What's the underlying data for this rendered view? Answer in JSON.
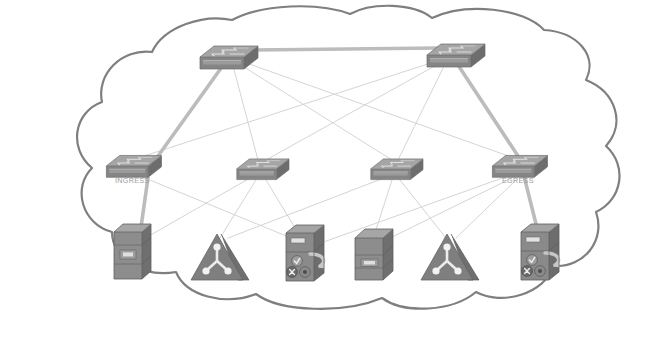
{
  "diagram": {
    "type": "network-topology",
    "canvas": {
      "width": 645,
      "height": 339
    },
    "colors": {
      "background": "#ffffff",
      "cloud_outline": "#7f7f7f",
      "cloud_fill": "#ffffff",
      "link_default": "#cfcfcf",
      "link_highlight": "#b3b3b3",
      "device_top": "#a8a8a8",
      "device_front": "#8f8f8f",
      "device_side": "#707070",
      "device_dark": "#6e6e6e",
      "label_text": "#9a9a9a",
      "icon_detail": "#e6e6e6"
    },
    "cloud": {
      "name": "network-cloud-boundary",
      "stroke_width": 2.2
    },
    "nodes": [
      {
        "id": "core-left",
        "kind": "switch",
        "label": "",
        "x": 228,
        "y": 55,
        "scale": 1.0,
        "tier": "core"
      },
      {
        "id": "core-right",
        "kind": "switch",
        "label": "",
        "x": 455,
        "y": 53,
        "scale": 1.0,
        "tier": "core"
      },
      {
        "id": "access-1",
        "kind": "switch",
        "label": "INGRESS",
        "x": 133,
        "y": 164,
        "scale": 0.95,
        "tier": "access"
      },
      {
        "id": "access-2",
        "kind": "switch",
        "label": "",
        "x": 262,
        "y": 167,
        "scale": 0.9,
        "tier": "access"
      },
      {
        "id": "access-3",
        "kind": "switch",
        "label": "",
        "x": 396,
        "y": 167,
        "scale": 0.9,
        "tier": "access"
      },
      {
        "id": "access-4",
        "kind": "switch",
        "label": "EGRESS",
        "x": 519,
        "y": 164,
        "scale": 0.95,
        "tier": "access"
      },
      {
        "id": "server-1",
        "kind": "server",
        "label": "",
        "x": 131,
        "y": 254,
        "scale": 1.0,
        "tier": "edge"
      },
      {
        "id": "loadbalancer-1",
        "kind": "triangle-hub",
        "label": "",
        "x": 219,
        "y": 258,
        "scale": 1.0,
        "tier": "edge"
      },
      {
        "id": "firewall-1",
        "kind": "firewall",
        "label": "",
        "x": 304,
        "y": 255,
        "scale": 1.0,
        "tier": "edge"
      },
      {
        "id": "server-2",
        "kind": "server",
        "label": "",
        "x": 372,
        "y": 256,
        "scale": 1.0,
        "tier": "edge"
      },
      {
        "id": "loadbalancer-2",
        "kind": "triangle-hub",
        "label": "",
        "x": 449,
        "y": 258,
        "scale": 1.0,
        "tier": "edge"
      },
      {
        "id": "firewall-2",
        "kind": "firewall",
        "label": "",
        "x": 539,
        "y": 254,
        "scale": 1.0,
        "tier": "edge"
      }
    ],
    "links": [
      {
        "from": "core-left",
        "to": "core-right",
        "highlight": true
      },
      {
        "from": "core-left",
        "to": "access-1",
        "highlight": true
      },
      {
        "from": "core-left",
        "to": "access-2",
        "highlight": false
      },
      {
        "from": "core-left",
        "to": "access-3",
        "highlight": false
      },
      {
        "from": "core-left",
        "to": "access-4",
        "highlight": false
      },
      {
        "from": "core-right",
        "to": "access-1",
        "highlight": false
      },
      {
        "from": "core-right",
        "to": "access-2",
        "highlight": false
      },
      {
        "from": "core-right",
        "to": "access-3",
        "highlight": false
      },
      {
        "from": "core-right",
        "to": "access-4",
        "highlight": true
      },
      {
        "from": "access-1",
        "to": "server-1",
        "highlight": true
      },
      {
        "from": "access-1",
        "to": "firewall-1",
        "highlight": false
      },
      {
        "from": "access-2",
        "to": "loadbalancer-1",
        "highlight": false
      },
      {
        "from": "access-2",
        "to": "firewall-1",
        "highlight": false
      },
      {
        "from": "access-2",
        "to": "server-1",
        "highlight": false
      },
      {
        "from": "access-3",
        "to": "server-2",
        "highlight": false
      },
      {
        "from": "access-3",
        "to": "loadbalancer-2",
        "highlight": false
      },
      {
        "from": "access-3",
        "to": "loadbalancer-1",
        "highlight": false
      },
      {
        "from": "access-4",
        "to": "firewall-2",
        "highlight": true
      },
      {
        "from": "access-4",
        "to": "loadbalancer-2",
        "highlight": false
      },
      {
        "from": "access-4",
        "to": "server-2",
        "highlight": false
      },
      {
        "from": "access-4",
        "to": "firewall-1",
        "highlight": false
      }
    ],
    "labels": {
      "ingress": "INGRESS",
      "egress": "EGRESS"
    }
  }
}
